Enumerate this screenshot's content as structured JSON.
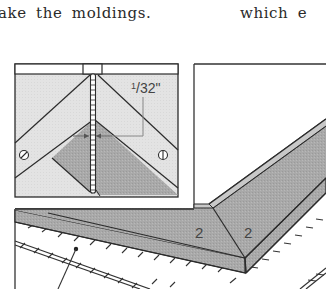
{
  "text": {
    "line_left": "ake the moldings.",
    "line_right": "which e"
  },
  "figure": {
    "inset": {
      "dimension_label": "1/32\"",
      "dimension_numerator": "1",
      "dimension_rest": "/32\""
    },
    "piece_labels": [
      "2",
      "2"
    ],
    "colors": {
      "line": "#2b2b2b",
      "inset_background": "#e2e2e2",
      "molding_gray": "#a8a8a8",
      "molding_dark": "#8f8f8f",
      "page": "#ffffff"
    }
  }
}
